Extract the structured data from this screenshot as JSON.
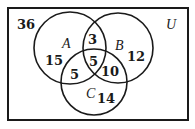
{
  "diagram": {
    "type": "venn",
    "universe_label": "U",
    "sets": [
      {
        "label": "A",
        "cx": 70,
        "cy": 48,
        "r": 36
      },
      {
        "label": "B",
        "cx": 118,
        "cy": 48,
        "r": 35
      },
      {
        "label": "C",
        "cx": 94,
        "cy": 82,
        "r": 33
      }
    ],
    "regions": {
      "outside": "36",
      "A_only": "15",
      "B_only": "12",
      "C_only": "14",
      "A_and_B_only": "3",
      "A_and_C_only": "5",
      "B_and_C_only": "10",
      "A_and_B_and_C": "5"
    },
    "colors": {
      "stroke": "#1a1a1a",
      "background": "#ffffff"
    }
  }
}
